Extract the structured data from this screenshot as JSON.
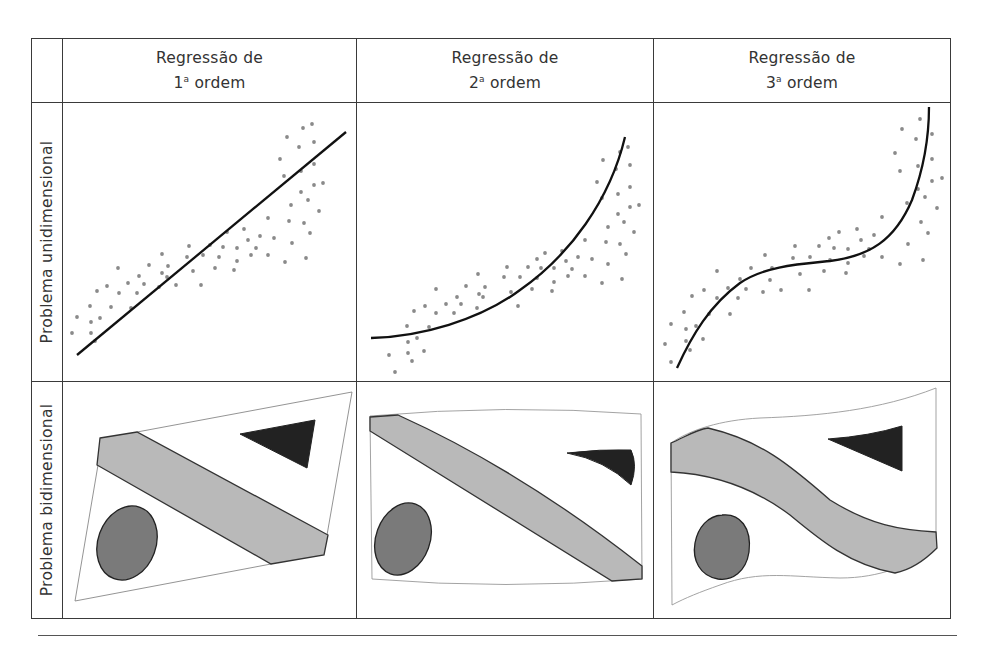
{
  "columns": [
    {
      "line1": "Regressão de",
      "ordinal": "1",
      "ordinal_sup": "a",
      "line2_rest": " ordem"
    },
    {
      "line1": "Regressão de",
      "ordinal": "2",
      "ordinal_sup": "a",
      "line2_rest": " ordem"
    },
    {
      "line1": "Regressão de",
      "ordinal": "3",
      "ordinal_sup": "a",
      "line2_rest": " ordem"
    }
  ],
  "rows": [
    {
      "label": "Problema unidimensional"
    },
    {
      "label": "Problema bidimensional"
    }
  ],
  "colors": {
    "border": "#3a3a3a",
    "dot": "#8a8a8a",
    "curve": "#111111",
    "band_fill": "#b9b9b9",
    "ellipse_fill": "#7a7a7a",
    "triangle_fill": "#222222",
    "frame_stroke": "#888888"
  },
  "chart_data": [
    {
      "type": "scatter",
      "title": "Regressão de 1ª ordem — Problema unidimensional",
      "fit": "linear",
      "fit_line": [
        [
          77,
          355
        ],
        [
          346,
          132
        ]
      ],
      "points": [
        [
          72,
          333
        ],
        [
          77,
          317
        ],
        [
          90,
          306
        ],
        [
          91,
          322
        ],
        [
          91,
          333
        ],
        [
          95,
          341
        ],
        [
          97,
          291
        ],
        [
          100,
          318
        ],
        [
          107,
          286
        ],
        [
          111,
          307
        ],
        [
          118,
          268
        ],
        [
          119,
          293
        ],
        [
          128,
          283
        ],
        [
          131,
          308
        ],
        [
          137,
          293
        ],
        [
          139,
          276
        ],
        [
          144,
          284
        ],
        [
          149,
          265
        ],
        [
          159,
          287
        ],
        [
          162,
          254
        ],
        [
          162,
          273
        ],
        [
          167,
          277
        ],
        [
          168,
          266
        ],
        [
          176,
          285
        ],
        [
          187,
          257
        ],
        [
          189,
          246
        ],
        [
          193,
          271
        ],
        [
          201,
          285
        ],
        [
          203,
          255
        ],
        [
          210,
          245
        ],
        [
          215,
          268
        ],
        [
          219,
          257
        ],
        [
          223,
          247
        ],
        [
          227,
          232
        ],
        [
          234,
          270
        ],
        [
          237,
          248
        ],
        [
          237,
          261
        ],
        [
          244,
          229
        ],
        [
          248,
          240
        ],
        [
          251,
          255
        ],
        [
          256,
          248
        ],
        [
          260,
          236
        ],
        [
          268,
          218
        ],
        [
          268,
          255
        ],
        [
          274,
          238
        ],
        [
          280,
          159
        ],
        [
          284,
          176
        ],
        [
          285,
          262
        ],
        [
          287,
          137
        ],
        [
          289,
          221
        ],
        [
          291,
          205
        ],
        [
          292,
          243
        ],
        [
          299,
          147
        ],
        [
          301,
          171
        ],
        [
          301,
          192
        ],
        [
          303,
          128
        ],
        [
          304,
          223
        ],
        [
          306,
          258
        ],
        [
          308,
          200
        ],
        [
          310,
          233
        ],
        [
          312,
          124
        ],
        [
          314,
          142
        ],
        [
          314,
          164
        ],
        [
          314,
          185
        ],
        [
          319,
          211
        ],
        [
          323,
          183
        ]
      ]
    },
    {
      "type": "scatter",
      "title": "Regressão de 2ª ordem — Problema unidimensional",
      "fit": "quadratic",
      "fit_path": "M371,338 C420,337 480,320 520,290 C570,255 610,200 625,137",
      "points": [
        [
          389,
          355
        ],
        [
          395,
          372
        ],
        [
          407,
          326
        ],
        [
          408,
          342
        ],
        [
          408,
          353
        ],
        [
          412,
          361
        ],
        [
          414,
          311
        ],
        [
          417,
          338
        ],
        [
          424,
          351
        ],
        [
          425,
          306
        ],
        [
          429,
          327
        ],
        [
          436,
          289
        ],
        [
          436,
          313
        ],
        [
          446,
          304
        ],
        [
          454,
          313
        ],
        [
          457,
          297
        ],
        [
          461,
          304
        ],
        [
          466,
          286
        ],
        [
          477,
          308
        ],
        [
          478,
          274
        ],
        [
          479,
          294
        ],
        [
          483,
          297
        ],
        [
          485,
          287
        ],
        [
          504,
          277
        ],
        [
          507,
          267
        ],
        [
          511,
          292
        ],
        [
          518,
          306
        ],
        [
          520,
          277
        ],
        [
          528,
          267
        ],
        [
          532,
          289
        ],
        [
          537,
          259
        ],
        [
          537,
          278
        ],
        [
          541,
          268
        ],
        [
          545,
          253
        ],
        [
          552,
          291
        ],
        [
          554,
          282
        ],
        [
          554,
          268
        ],
        [
          562,
          251
        ],
        [
          566,
          261
        ],
        [
          568,
          276
        ],
        [
          572,
          269
        ],
        [
          578,
          257
        ],
        [
          585,
          240
        ],
        [
          585,
          276
        ],
        [
          592,
          259
        ],
        [
          597,
          182
        ],
        [
          602,
          283
        ],
        [
          602,
          198
        ],
        [
          603,
          160
        ],
        [
          606,
          242
        ],
        [
          608,
          227
        ],
        [
          608,
          264
        ],
        [
          616,
          169
        ],
        [
          618,
          194
        ],
        [
          618,
          214
        ],
        [
          620,
          152
        ],
        [
          620,
          244
        ],
        [
          622,
          279
        ],
        [
          624,
          222
        ],
        [
          626,
          254
        ],
        [
          628,
          147
        ],
        [
          630,
          165
        ],
        [
          630,
          187
        ],
        [
          630,
          207
        ],
        [
          634,
          232
        ],
        [
          639,
          205
        ]
      ]
    },
    {
      "type": "scatter",
      "title": "Regressão de 3ª ordem — Problema unidimensional",
      "fit": "cubic",
      "fit_path": "M677,368 C692,335 710,305 740,283 C765,266 800,264 830,261 C870,256 895,240 912,200 C925,165 929,130 929,107",
      "points": [
        [
          665,
          344
        ],
        [
          671,
          324
        ],
        [
          671,
          362
        ],
        [
          684,
          312
        ],
        [
          686,
          329
        ],
        [
          686,
          341
        ],
        [
          690,
          350
        ],
        [
          692,
          296
        ],
        [
          696,
          326
        ],
        [
          703,
          339
        ],
        [
          704,
          290
        ],
        [
          709,
          314
        ],
        [
          717,
          271
        ],
        [
          717,
          298
        ],
        [
          728,
          288
        ],
        [
          730,
          314
        ],
        [
          738,
          298
        ],
        [
          740,
          279
        ],
        [
          746,
          289
        ],
        [
          751,
          268
        ],
        [
          763,
          292
        ],
        [
          765,
          255
        ],
        [
          770,
          280
        ],
        [
          772,
          268
        ],
        [
          781,
          290
        ],
        [
          793,
          258
        ],
        [
          795,
          246
        ],
        [
          800,
          274
        ],
        [
          809,
          290
        ],
        [
          810,
          257
        ],
        [
          819,
          246
        ],
        [
          824,
          271
        ],
        [
          829,
          238
        ],
        [
          830,
          260
        ],
        [
          834,
          248
        ],
        [
          839,
          232
        ],
        [
          846,
          273
        ],
        [
          848,
          249
        ],
        [
          848,
          263
        ],
        [
          857,
          229
        ],
        [
          861,
          240
        ],
        [
          864,
          256
        ],
        [
          869,
          249
        ],
        [
          874,
          235
        ],
        [
          882,
          217
        ],
        [
          882,
          257
        ],
        [
          895,
          153
        ],
        [
          900,
          171
        ],
        [
          900,
          264
        ],
        [
          902,
          129
        ],
        [
          907,
          203
        ],
        [
          908,
          244
        ],
        [
          916,
          139
        ],
        [
          918,
          166
        ],
        [
          918,
          189
        ],
        [
          920,
          119
        ],
        [
          921,
          222
        ],
        [
          923,
          260
        ],
        [
          925,
          197
        ],
        [
          928,
          233
        ],
        [
          932,
          134
        ],
        [
          932,
          159
        ],
        [
          932,
          181
        ],
        [
          937,
          208
        ],
        [
          942,
          178
        ]
      ]
    }
  ]
}
